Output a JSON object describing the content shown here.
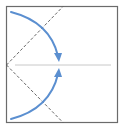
{
  "diagram": {
    "type": "origami-fold-step",
    "colors": {
      "paper_border": "#6b6b6b",
      "dashed_fold": "#555555",
      "center_crease": "#c8c8c8",
      "arrow": "#5b8fd0",
      "background": "#ffffff"
    },
    "elements": [
      {
        "name": "paper-square",
        "kind": "rect"
      },
      {
        "name": "valley-fold-upper",
        "kind": "dashed-line"
      },
      {
        "name": "valley-fold-lower",
        "kind": "dashed-line"
      },
      {
        "name": "center-crease",
        "kind": "line"
      },
      {
        "name": "fold-arrow-top",
        "kind": "curved-arrow",
        "direction": "down"
      },
      {
        "name": "fold-arrow-bottom",
        "kind": "curved-arrow",
        "direction": "up"
      }
    ]
  }
}
